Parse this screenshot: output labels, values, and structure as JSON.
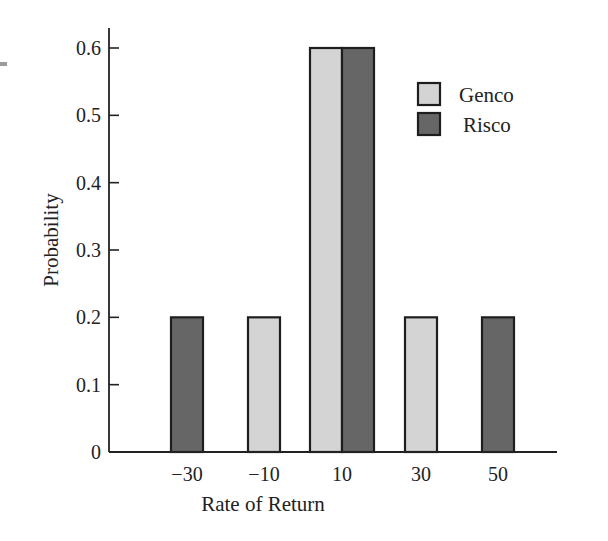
{
  "chart_data": {
    "type": "bar",
    "title": "",
    "xlabel": "Rate of Return",
    "ylabel": "Probability",
    "categories": [
      "−30",
      "−10",
      "10",
      "30",
      "50"
    ],
    "series": [
      {
        "name": "Genco",
        "color": "#d4d4d4",
        "values": [
          0,
          0.2,
          0.6,
          0.2,
          0
        ]
      },
      {
        "name": "Risco",
        "color": "#666666",
        "values": [
          0.2,
          0,
          0.6,
          0,
          0.2
        ]
      }
    ],
    "yticks": [
      "0",
      "0.1",
      "0.2",
      "0.3",
      "0.4",
      "0.5",
      "0.6"
    ],
    "ylim": [
      0,
      0.6
    ],
    "grid": false,
    "legend_position": "upper right"
  }
}
